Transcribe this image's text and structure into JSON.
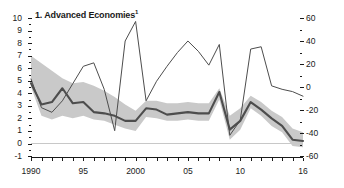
{
  "chart_data": {
    "type": "line",
    "title": "1. Advanced Economies",
    "title_superscript": "1",
    "xlabel": "",
    "ylabel_left": "",
    "ylabel_right": "",
    "xlim": [
      1990,
      2016
    ],
    "ylim_left": [
      -1,
      10
    ],
    "ylim_right": [
      -60,
      60
    ],
    "yticks_left": [
      10,
      9,
      8,
      7,
      6,
      5,
      4,
      3,
      2,
      1,
      0,
      -1
    ],
    "yticks_right": [
      60,
      40,
      20,
      0,
      -20,
      -40,
      -60
    ],
    "xticks": [
      1990,
      1995,
      2000,
      2005,
      2010,
      2016
    ],
    "xtick_labels": [
      "1990",
      "95",
      "2000",
      "05",
      "10",
      "16"
    ],
    "grid": false,
    "legend": "none",
    "zero_line": true,
    "x": [
      1990,
      1991,
      1992,
      1993,
      1994,
      1995,
      1996,
      1997,
      1998,
      1999,
      2000,
      2001,
      2002,
      2003,
      2004,
      2005,
      2006,
      2007,
      2008,
      2009,
      2010,
      2011,
      2012,
      2013,
      2014,
      2015,
      2016
    ],
    "series": [
      {
        "name": "Inflation (left scale)",
        "axis": "left",
        "style": "thick-dark-line",
        "color": "#4d4d4d",
        "values": [
          4.8,
          3.1,
          3.3,
          4.4,
          3.2,
          3.3,
          2.5,
          2.4,
          2.2,
          1.8,
          1.8,
          2.8,
          2.7,
          2.3,
          2.4,
          2.5,
          2.4,
          2.4,
          4.1,
          1.1,
          1.8,
          3.3,
          2.7,
          2.0,
          1.4,
          0.3,
          0.2
        ]
      },
      {
        "name": "Commodity price change (right scale)",
        "axis": "right",
        "style": "thin-dark-line",
        "color": "#4d4d4d",
        "values": [
          7,
          -18,
          -22,
          -12,
          3,
          18,
          21,
          -2,
          -38,
          40,
          57,
          -12,
          5,
          18,
          30,
          40,
          31,
          19,
          37,
          -42,
          -29,
          33,
          35,
          1,
          -2,
          -4,
          -8
        ]
      }
    ],
    "band": {
      "name": "Interquartile range (left scale)",
      "axis": "left",
      "color": "#c9c9c9",
      "upper": [
        7.0,
        6.4,
        5.8,
        5.2,
        4.8,
        4.9,
        4.6,
        4.2,
        3.7,
        3.1,
        2.6,
        3.4,
        3.4,
        3.2,
        3.2,
        3.3,
        3.2,
        3.2,
        4.4,
        2.2,
        2.8,
        3.8,
        3.3,
        2.6,
        2.1,
        1.2,
        0.9
      ],
      "lower": [
        4.5,
        2.2,
        1.9,
        2.2,
        2.0,
        2.2,
        1.9,
        1.8,
        1.5,
        1.2,
        1.0,
        2.1,
        2.0,
        1.8,
        1.8,
        1.9,
        1.8,
        1.8,
        3.5,
        0.3,
        1.1,
        2.8,
        2.2,
        1.4,
        0.9,
        -0.2,
        -0.3
      ]
    }
  }
}
